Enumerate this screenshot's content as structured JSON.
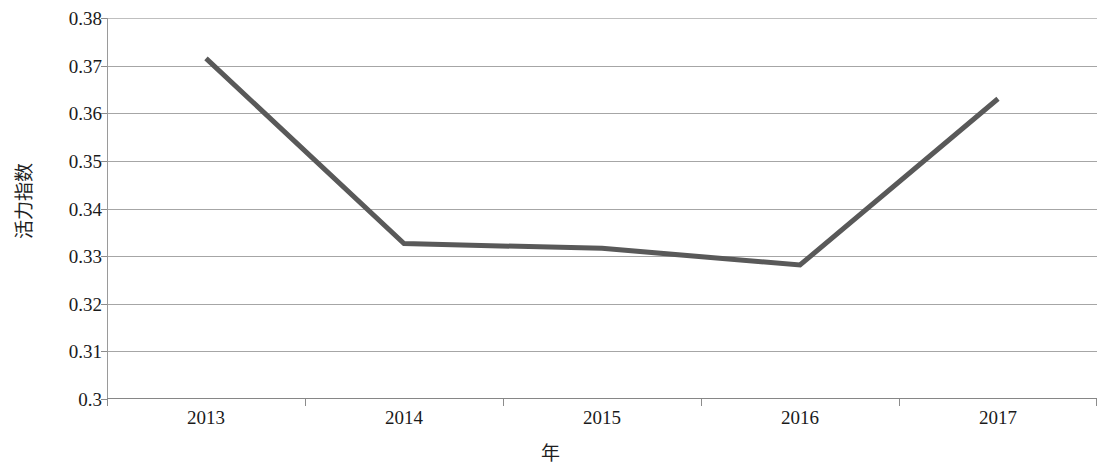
{
  "chart_data": {
    "type": "line",
    "title": "",
    "subtitle": "",
    "xlabel": "年",
    "ylabel": "活力指数",
    "categories": [
      "2013",
      "2014",
      "2015",
      "2016",
      "2017"
    ],
    "values": [
      0.3715,
      0.3325,
      0.3315,
      0.328,
      0.363
    ],
    "series": [
      {
        "name": "活力指数",
        "values": [
          0.3715,
          0.3325,
          0.3315,
          0.328,
          0.363
        ]
      }
    ],
    "ylim": [
      0.3,
      0.38
    ],
    "yticks": [
      "0.3",
      "0.31",
      "0.32",
      "0.33",
      "0.34",
      "0.35",
      "0.36",
      "0.37",
      "0.38"
    ],
    "ytick_values": [
      0.3,
      0.31,
      0.32,
      0.33,
      0.34,
      0.35,
      0.36,
      0.37,
      0.38
    ],
    "xticks": [
      "2013",
      "2014",
      "2015",
      "2016",
      "2017"
    ],
    "grid": "horizontal",
    "legend": "none",
    "line_color": "#595959",
    "line_width": 5,
    "markers": "none",
    "background_color": "#ffffff",
    "gridline_color": "#a6a6a6",
    "axis_color": "#868686"
  },
  "axes": {
    "y_title": "活力指数",
    "x_title": "年"
  }
}
